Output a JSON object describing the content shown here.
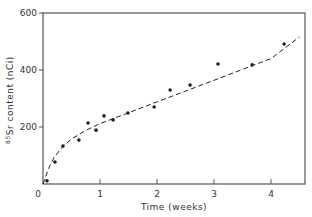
{
  "chart_data": {
    "type": "scatter",
    "title": "",
    "xlabel": "Time (weeks)",
    "ylabel": "85Sr content (nCi)",
    "ylabel_superscript": "85",
    "ylabel_rest": "Sr content (nCi)",
    "xlim": [
      0,
      4.5
    ],
    "ylim": [
      0,
      600
    ],
    "x_ticks": [
      0,
      1,
      2,
      3,
      4
    ],
    "x_tick_labels": [
      "0",
      "1",
      "2",
      "3",
      "4"
    ],
    "y_ticks": [
      200,
      400,
      600
    ],
    "y_tick_labels": [
      "200",
      "400",
      "600"
    ],
    "origin_label": "0",
    "grid": false,
    "legend": null,
    "series": [
      {
        "name": "measured",
        "style": "points",
        "x": [
          0.07,
          0.21,
          0.35,
          0.63,
          0.79,
          0.93,
          1.07,
          1.23,
          1.49,
          1.95,
          2.23,
          2.58,
          3.07,
          3.67,
          4.23
        ],
        "y": [
          11,
          77,
          133,
          154,
          214,
          189,
          239,
          225,
          249,
          270,
          330,
          347,
          421,
          418,
          491
        ]
      },
      {
        "name": "fit",
        "style": "dashed-line",
        "x": [
          0.0,
          0.1,
          0.2,
          0.35,
          0.5,
          0.75,
          1.0,
          1.5,
          2.0,
          2.5,
          3.0,
          3.5,
          4.0,
          4.5
        ],
        "y": [
          0,
          55,
          95,
          132,
          158,
          188,
          212,
          250,
          288,
          326,
          364,
          402,
          440,
          516
        ]
      }
    ]
  },
  "colors": {
    "ink": "#222222",
    "axis": "#555555",
    "background": "#ffffff"
  }
}
